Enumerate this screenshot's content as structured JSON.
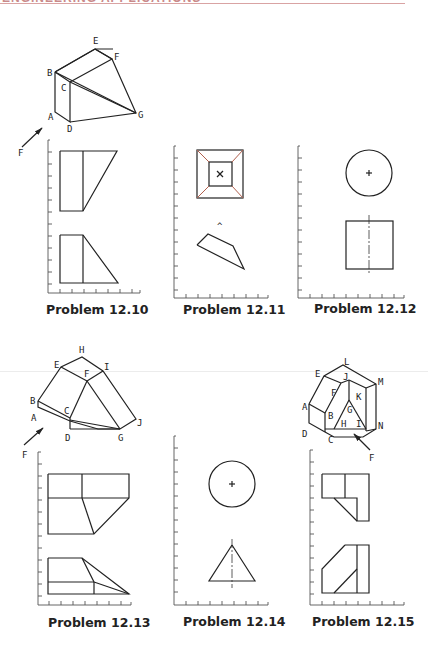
{
  "header": {
    "title": "ENGINEERING APPLICATIONS",
    "rule_color": "#d9a3a3"
  },
  "problems": [
    {
      "id": "12.10",
      "caption": "Problem 12.10",
      "pictorial_labels": [
        "A",
        "B",
        "C",
        "D",
        "E",
        "F",
        "G"
      ],
      "view_arrow": "F"
    },
    {
      "id": "12.11",
      "caption": "Problem 12.11",
      "accent_color": "#b0604e"
    },
    {
      "id": "12.12",
      "caption": "Problem 12.12"
    },
    {
      "id": "12.13",
      "caption": "Problem 12.13",
      "pictorial_labels": [
        "A",
        "B",
        "C",
        "D",
        "E",
        "F",
        "G",
        "H",
        "I",
        "J"
      ],
      "view_arrow": "F"
    },
    {
      "id": "12.14",
      "caption": "Problem 12.14"
    },
    {
      "id": "12.15",
      "caption": "Problem 12.15",
      "pictorial_labels": [
        "A",
        "B",
        "C",
        "D",
        "E",
        "F",
        "G",
        "H",
        "I",
        "J",
        "K",
        "L",
        "M",
        "N"
      ],
      "view_arrow": "F"
    }
  ],
  "labels": {
    "p10": {
      "A": "A",
      "B": "B",
      "C": "C",
      "D": "D",
      "E": "E",
      "F": "F",
      "G": "G",
      "arrow": "F"
    },
    "p13": {
      "A": "A",
      "B": "B",
      "C": "C",
      "D": "D",
      "E": "E",
      "F": "F",
      "G": "G",
      "H": "H",
      "I": "I",
      "J": "J",
      "arrow": "F",
      "axisF": "F"
    },
    "p15": {
      "A": "A",
      "B": "B",
      "C": "C",
      "D": "D",
      "E": "E",
      "F": "F",
      "G": "G",
      "H": "H",
      "I": "I",
      "J": "J",
      "K": "K",
      "L": "L",
      "M": "M",
      "N": "N",
      "arrow": "F"
    },
    "p11": {
      "caret": "^"
    }
  }
}
